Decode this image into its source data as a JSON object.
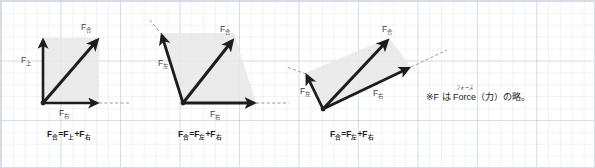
{
  "figure": {
    "type": "vector-addition-diagrams",
    "background": "graph-paper",
    "grid_color": "#9aaac8",
    "arrow_color": "#1d1d1d",
    "shade_color": "#e6e6e6",
    "dashed_color": "#8d8d8d"
  },
  "diagrams": [
    {
      "id": "diagram-1",
      "name": "up-plus-right",
      "origin": [
        42,
        102
      ],
      "vectors": [
        {
          "name": "component-up",
          "label_f": "F",
          "label_sub": "上",
          "from": [
            42,
            102
          ],
          "to": [
            42,
            37
          ],
          "label_pos": [
            22,
            57
          ]
        },
        {
          "name": "component-right",
          "label_f": "F",
          "label_sub": "右",
          "from": [
            42,
            102
          ],
          "to": [
            98,
            102
          ],
          "label_pos": [
            61,
            110
          ]
        },
        {
          "name": "resultant",
          "label_f": "F",
          "label_sub": "合",
          "from": [
            42,
            102
          ],
          "to": [
            98,
            37
          ],
          "label_pos": [
            82,
            25
          ]
        }
      ],
      "parallelogram": [
        [
          42,
          102
        ],
        [
          42,
          37
        ],
        [
          98,
          37
        ],
        [
          98,
          102
        ]
      ],
      "dashed": [
        {
          "from": [
            98,
            102
          ],
          "to": [
            130,
            102
          ]
        }
      ],
      "caption": {
        "terms": [
          {
            "f": "F",
            "sub": "合"
          },
          {
            "op": "="
          },
          {
            "f": "F",
            "sub": "上"
          },
          {
            "op": "+"
          },
          {
            "f": "F",
            "sub": "右"
          }
        ],
        "pos": [
          48,
          129
        ]
      }
    },
    {
      "id": "diagram-2",
      "name": "upleft-plus-right",
      "origin": [
        182,
        102
      ],
      "vectors": [
        {
          "name": "component-upper-left",
          "label_f": "F",
          "label_sub": "左",
          "from": [
            182,
            102
          ],
          "to": [
            160,
            32
          ],
          "label_pos": [
            158,
            60
          ]
        },
        {
          "name": "component-right",
          "label_f": "F",
          "label_sub": "右",
          "from": [
            182,
            102
          ],
          "to": [
            255,
            102
          ],
          "label_pos": [
            212,
            111
          ]
        },
        {
          "name": "resultant",
          "label_f": "F",
          "label_sub": "合",
          "from": [
            182,
            102
          ],
          "to": [
            233,
            37
          ],
          "label_pos": [
            220,
            27
          ]
        }
      ],
      "parallelogram": [
        [
          182,
          102
        ],
        [
          160,
          32
        ],
        [
          233,
          32
        ],
        [
          255,
          102
        ]
      ],
      "dashed": [
        {
          "from": [
            160,
            32
          ],
          "to": [
            148,
            18
          ]
        },
        {
          "from": [
            255,
            102
          ],
          "to": [
            288,
            102
          ]
        }
      ],
      "caption": {
        "terms": [
          {
            "f": "F",
            "sub": "合"
          },
          {
            "op": "="
          },
          {
            "f": "F",
            "sub": "左"
          },
          {
            "op": "+"
          },
          {
            "f": "F",
            "sub": "右"
          }
        ],
        "pos": [
          178,
          129
        ]
      }
    },
    {
      "id": "diagram-3",
      "name": "upleft-plus-upright",
      "origin": [
        322,
        108
      ],
      "vectors": [
        {
          "name": "component-upper-left",
          "label_f": "F",
          "label_sub": "左",
          "from": [
            322,
            108
          ],
          "to": [
            304,
            72
          ],
          "label_pos": [
            300,
            86
          ]
        },
        {
          "name": "component-upper-right",
          "label_f": "F",
          "label_sub": "右",
          "from": [
            322,
            108
          ],
          "to": [
            410,
            66
          ],
          "label_pos": [
            376,
            90
          ]
        },
        {
          "name": "resultant",
          "label_f": "F",
          "label_sub": "合",
          "from": [
            322,
            108
          ],
          "to": [
            388,
            37
          ],
          "label_pos": [
            382,
            25
          ]
        }
      ],
      "parallelogram": [
        [
          322,
          108
        ],
        [
          304,
          72
        ],
        [
          388,
          37
        ],
        [
          410,
          66
        ]
      ],
      "dashed": [
        {
          "from": [
            304,
            72
          ],
          "to": [
            286,
            66
          ]
        },
        {
          "from": [
            410,
            66
          ],
          "to": [
            444,
            50
          ]
        }
      ],
      "caption": {
        "terms": [
          {
            "f": "F",
            "sub": "合"
          },
          {
            "op": "="
          },
          {
            "f": "F",
            "sub": "左"
          },
          {
            "op": "+"
          },
          {
            "f": "F",
            "sub": "右"
          }
        ],
        "pos": [
          330,
          129
        ]
      }
    }
  ],
  "note": {
    "mark": "※",
    "f": "F",
    "wa": "は",
    "word": "Force",
    "ruby": "フォース",
    "paren_open": "（",
    "power": "力",
    "paren_close": "）",
    "tail": "の略。"
  }
}
